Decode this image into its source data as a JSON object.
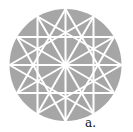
{
  "figure": {
    "label": "a.",
    "circle": {
      "cx": 65.5,
      "cy": 65,
      "r": 56
    },
    "points_count": 12,
    "colors": {
      "fill": "#a6a6a6",
      "lines": "#ffffff",
      "label": "#111111",
      "background": "#ffffff"
    }
  }
}
